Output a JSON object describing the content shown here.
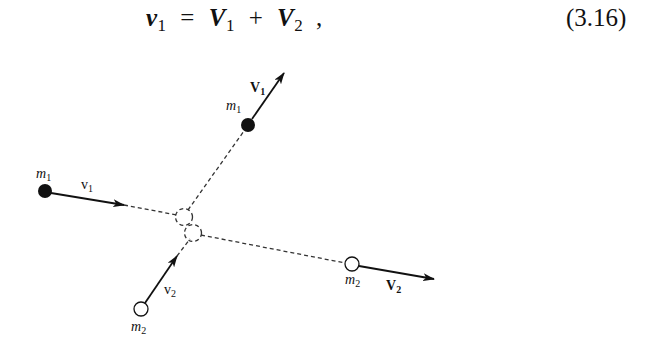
{
  "equation": {
    "lhs_symbol": "v",
    "lhs_sub": "1",
    "equals": "=",
    "term1_symbol": "V",
    "term1_sub": "1",
    "plus": "+",
    "term2_symbol": "V",
    "term2_sub": "2",
    "trailing": ",",
    "number": "(3.16)"
  },
  "figure": {
    "labels": {
      "m1_top": {
        "symbol": "m",
        "sub": "1"
      },
      "V1_top": {
        "symbol": "V",
        "sub": "1"
      },
      "m1_left": {
        "symbol": "m",
        "sub": "1"
      },
      "v1_left": {
        "symbol": "v",
        "sub": "1"
      },
      "v2_bottom": {
        "symbol": "v",
        "sub": "2"
      },
      "m2_bottom": {
        "symbol": "m",
        "sub": "2"
      },
      "m2_right": {
        "symbol": "m",
        "sub": "2"
      },
      "V2_right": {
        "symbol": "V",
        "sub": "2"
      }
    },
    "colors": {
      "ink": "#111111",
      "filled_ball": "#111111",
      "hollow_ball": "#ffffff"
    }
  }
}
